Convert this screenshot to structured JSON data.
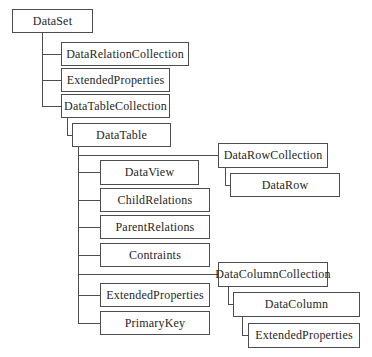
{
  "diagram_subject": "DataSet object hierarchy",
  "colors": {
    "background": "#ffffff",
    "box_border": "#4d4d4d",
    "connector_line": "#4d4d4d",
    "text": "#262626"
  },
  "nodes": {
    "dataset": "DataSet",
    "data_relation_collection": "DataRelationCollection",
    "extended_properties_dataset": "ExtendedProperties",
    "data_table_collection": "DataTableCollection",
    "data_table": "DataTable",
    "data_row_collection": "DataRowCollection",
    "data_row": "DataRow",
    "data_view": "DataView",
    "child_relations": "ChildRelations",
    "parent_relations": "ParentRelations",
    "contraints": "Contraints",
    "data_column_collection": "DataColumnCollection",
    "extended_properties_table": "ExtendedProperties",
    "primary_key": "PrimaryKey",
    "data_column": "DataColumn",
    "extended_properties_column": "ExtendedProperties"
  },
  "hierarchy": {
    "DataSet": {
      "DataRelationCollection": {},
      "ExtendedProperties": {},
      "DataTableCollection": {
        "DataTable": {
          "DataRowCollection": {
            "DataRow": {}
          },
          "DataView": {},
          "ChildRelations": {},
          "ParentRelations": {},
          "Contraints": {},
          "DataColumnCollection": {
            "DataColumn": {
              "ExtendedProperties": {}
            }
          },
          "ExtendedProperties": {},
          "PrimaryKey": {}
        }
      }
    }
  }
}
